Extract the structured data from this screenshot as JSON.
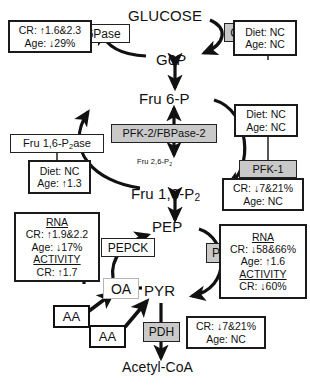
{
  "diagram": {
    "colors": {
      "stroke": "#111111",
      "enzyme_shaded_fill": "#c9c9c9",
      "enzyme_plain_fill": "#ffffff",
      "box_border": "#1a1a1a",
      "background": "#ffffff"
    }
  },
  "metabolites": {
    "glucose": "GLUCOSE",
    "g6p": "G6P",
    "fru6p": "Fru 6-P",
    "fru26p2_pre": "Fru 2,6-P",
    "fru26p2_sub": "2",
    "fru16p2_pre": "Fru 1,6-P",
    "fru16p2_sub": "2",
    "pep": "PEP",
    "oa": "OA",
    "pyr": "PYR",
    "acetyl_coa": "Acetyl-CoA",
    "aa_left": "AA",
    "aa_right": "AA"
  },
  "enzymes": {
    "g6pase": {
      "label": "G6Pase",
      "shaded": false
    },
    "gk": {
      "label": "GK",
      "shaded": true
    },
    "fru16p2ase_pre": "Fru 1,6-P",
    "fru16p2ase_sub": "2",
    "fru16p2ase_post": "ase",
    "pfk2_fbpase2": {
      "label": "PFK-2/FBPase-2",
      "shaded": true
    },
    "pfk1": {
      "label": "PFK-1",
      "shaded": true
    },
    "pepck": {
      "label": "PEPCK",
      "shaded": false
    },
    "pk": {
      "label": "PK",
      "shaded": true
    },
    "pdh": {
      "label": "PDH",
      "shaded": true
    }
  },
  "annotations": {
    "g6pase_box": {
      "name": "g6pase-annotation",
      "lines": [
        "CR: ↑1.6&2.3",
        "Age: ↓29%"
      ]
    },
    "gk_box": {
      "name": "gk-annotation",
      "lines": [
        "Diet: NC",
        "Age: NC"
      ]
    },
    "fru16p2ase_box": {
      "name": "fru16p2ase-annotation",
      "lines": [
        "Diet: NC",
        "Age: ↑1.3"
      ]
    },
    "pfk1_upper_box": {
      "name": "pfk1-upper-annotation",
      "lines": [
        "Diet: NC",
        "Age: NC"
      ]
    },
    "pfk1_lower_box": {
      "name": "pfk1-lower-annotation",
      "lines": [
        "CR: ↓7&21%",
        "Age: NC"
      ]
    },
    "pepck_box": {
      "name": "pepck-annotation",
      "lines": [
        {
          "text": "RNA",
          "header": true
        },
        {
          "text": "CR: ↑1.9&2.2",
          "header": false
        },
        {
          "text": "Age: ↓17%",
          "header": false
        },
        {
          "text": "ACTIVITY",
          "header": true
        },
        {
          "text": "CR: ↑1.7",
          "header": false
        }
      ]
    },
    "pk_box": {
      "name": "pk-annotation",
      "lines": [
        {
          "text": "RNA",
          "header": true
        },
        {
          "text": "CR: ↓58&66%",
          "header": false
        },
        {
          "text": "Age: ↑1.6",
          "header": false
        },
        {
          "text": "ACTIVITY",
          "header": true
        },
        {
          "text": "CR: ↓60%",
          "header": false
        }
      ]
    },
    "pdh_box": {
      "name": "pdh-annotation",
      "lines": [
        "CR: ↓7&21%",
        "Age: NC"
      ]
    }
  }
}
